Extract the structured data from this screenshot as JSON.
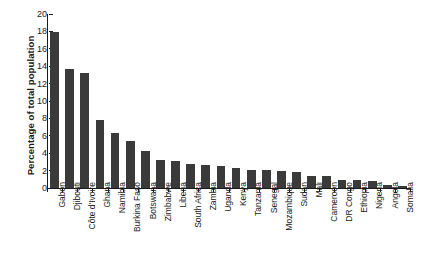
{
  "chart_data": {
    "type": "bar",
    "title": "",
    "subtitle": "",
    "xlabel": "",
    "ylabel": "Percentage of total population",
    "ylim": [
      0,
      20
    ],
    "ytick_step": 2,
    "yticks": [
      0,
      2,
      4,
      6,
      8,
      10,
      12,
      14,
      16,
      18,
      20
    ],
    "grid": false,
    "legend": null,
    "bar_color": "#3a3a3a",
    "axis_color": "#1a1a1a",
    "background": "#ffffff",
    "categories": [
      "Gabon",
      "Djibouti",
      "Côte d'Ivoire",
      "Ghana",
      "Namibia",
      "Burkina Faso",
      "Botswana",
      "Zimbabwe",
      "Liberia",
      "South Africa",
      "Zambia",
      "Uganda",
      "Kenya",
      "Tanzania",
      "Senegal",
      "Mozambique",
      "Sudan",
      "Mali",
      "Cameroon",
      "DR Congo",
      "Ethiopia",
      "Nigeria",
      "Angola",
      "Somalia"
    ],
    "values": [
      17.9,
      13.7,
      13.2,
      7.8,
      6.3,
      5.4,
      4.3,
      3.2,
      3.1,
      2.8,
      2.6,
      2.5,
      2.3,
      2.1,
      2.1,
      2.0,
      1.8,
      1.4,
      1.35,
      0.9,
      0.9,
      0.85,
      0.35,
      0.25
    ]
  }
}
